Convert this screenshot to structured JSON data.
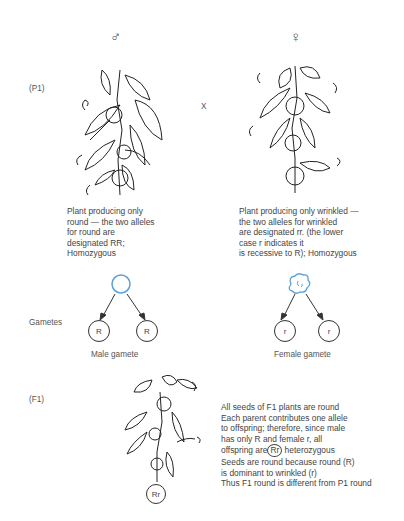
{
  "title_symbols": {
    "male": "♂",
    "female": "♀"
  },
  "generations": {
    "p1": "(P1)",
    "f1": "(F1)"
  },
  "cross_symbol": "X",
  "parents": {
    "male": {
      "description": "Plant producing only\nround — the two alleles\nfor round are\ndesignated RR;\nHomozygous",
      "seed_shape": "round",
      "seed_color": "#5aa0d8"
    },
    "female": {
      "description": "Plant producing only wrinkled —\nthe two alleles for wrinkled\nare designated rr. (the lower\ncase r indicates it\nis recessive to R); Homozygous",
      "seed_shape": "wrinkled",
      "seed_color": "#5aa0d8"
    }
  },
  "gametes": {
    "label": "Gametes",
    "male": {
      "alleles": [
        "R",
        "R"
      ],
      "caption": "Male gamete"
    },
    "female": {
      "alleles": [
        "r",
        "r"
      ],
      "caption": "Female gamete"
    }
  },
  "f1": {
    "genotype": "Rr",
    "notes": {
      "line1": "All seeds of F1 plants are round",
      "line2": "Each parent contributes one allele",
      "line3": "to offspring; therefore, since male",
      "line4": "has only R and female r, all",
      "line5_pre": "offspring are",
      "line5_circled": "Rr",
      "line5_post": " heterozygous",
      "line6": "Seeds are round because round (R)",
      "line7": "is dominant to wrinkled (r)",
      "line8": "Thus F1 round is different from P1 round"
    }
  }
}
